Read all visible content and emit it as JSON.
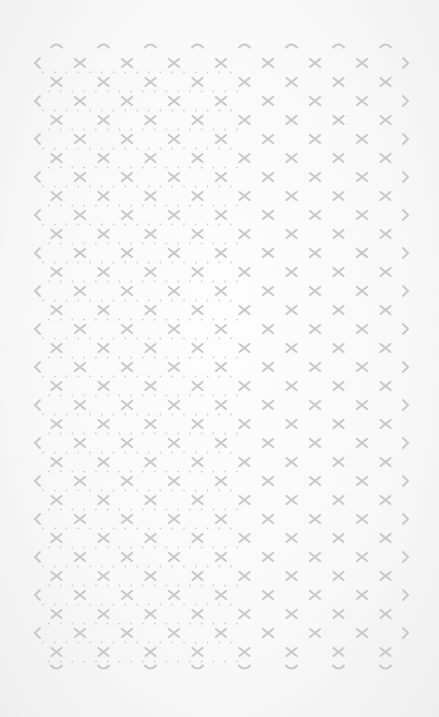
{
  "pattern": {
    "name": "diamond lattice with cross marks",
    "mark_color": "#c9c9c9",
    "dot_color": "#d0d0d0",
    "background": "#f9f9f9",
    "col_spacing": 47,
    "row_spacing": 19,
    "left_edge_x": 37,
    "first_cross_x": 80,
    "right_edge_x": 406,
    "top_arc_y": 45,
    "first_row_y": 63,
    "bottom_arc_y": 668,
    "columns": 8,
    "rows": 33
  }
}
